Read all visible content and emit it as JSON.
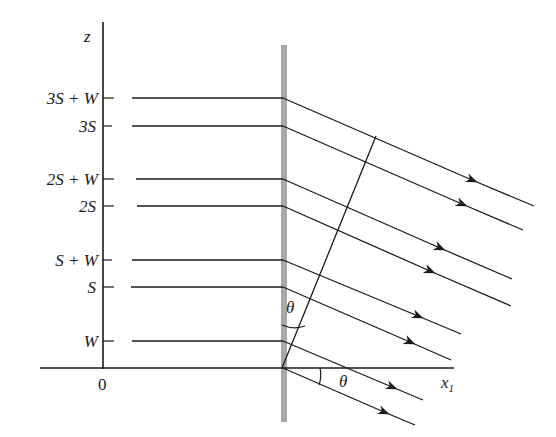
{
  "diagram": {
    "axes": {
      "z_label": "z",
      "x_label": "x",
      "x_subscript": "1",
      "origin_label": "0"
    },
    "levels": [
      {
        "label": "3S + W",
        "y": 98
      },
      {
        "label": "3S",
        "y": 126
      },
      {
        "label": "2S + W",
        "y": 179
      },
      {
        "label": "2S",
        "y": 206
      },
      {
        "label": "S + W",
        "y": 260
      },
      {
        "label": "S",
        "y": 287
      },
      {
        "label": "W",
        "y": 341
      }
    ],
    "angle_labels": {
      "upper": "θ",
      "lower": "θ"
    },
    "colors": {
      "line": "#1a1a1a",
      "wall": "#a8a8a8",
      "background": "#ffffff"
    }
  }
}
